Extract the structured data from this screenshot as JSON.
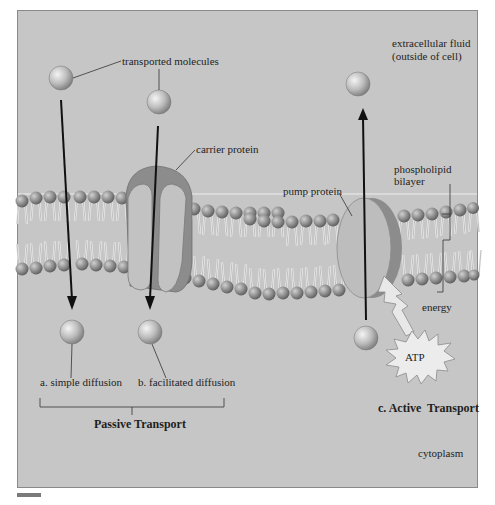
{
  "figure": {
    "regions": {
      "outside": "extracellular fluid (outside of cell)",
      "outside_line1": "extracellular fluid",
      "outside_line2": "(outside of cell)",
      "inside": "cytoplasm"
    },
    "labels": {
      "transported_molecules": "transported molecules",
      "carrier_protein": "carrier protein",
      "pump_protein": "pump protein",
      "phospholipid_line1": "phospholipid",
      "phospholipid_line2": "bilayer",
      "energy": "energy",
      "atp": "ATP"
    },
    "mechanisms": [
      {
        "id": "a",
        "label": "a. simple diffusion",
        "direction": "down",
        "group": "passive"
      },
      {
        "id": "b",
        "label": "b. facilitated diffusion",
        "direction": "down",
        "group": "passive"
      },
      {
        "id": "c",
        "label": "c. Active  Transport",
        "direction": "up",
        "group": "active"
      }
    ],
    "groups": {
      "passive": "Passive Transport"
    },
    "colors": {
      "background": "#c6c6c6",
      "membrane_head": "#8e8e8e",
      "protein_fill": "#b9b9b9",
      "protein_shadow": "#8c8c8c",
      "atp_burst": "#ececec",
      "arrow": "#111111"
    }
  }
}
